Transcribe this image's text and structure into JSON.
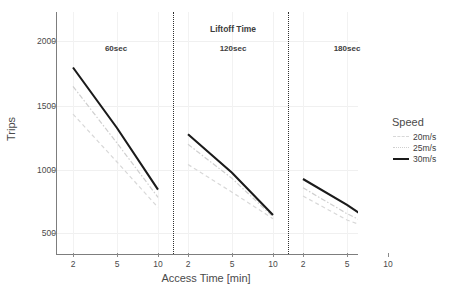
{
  "chart_data": {
    "type": "line",
    "title": "",
    "xlabel": "Access Time [min]",
    "ylabel": "Trips",
    "facet_title": "Liftoff Time",
    "facets": [
      "60sec",
      "120sec",
      "180sec"
    ],
    "categories": [
      "2",
      "5",
      "10"
    ],
    "x_tick_labels": [
      "2",
      "5",
      "10"
    ],
    "y_tick_labels": [
      "500",
      "1000",
      "1500",
      "2000"
    ],
    "y_ticks": [
      500,
      1000,
      1500,
      2000
    ],
    "ylim": [
      330,
      2250
    ],
    "grid": true,
    "legend_position": "right",
    "legend_title": "Speed",
    "series": [
      {
        "name": "20m/s",
        "style": "dashed",
        "color": "#d8d8d8",
        "values_60sec": [
          1440,
          1060,
          700
        ],
        "values_120sec": [
          1040,
          820,
          610
        ],
        "values_180sec": [
          790,
          600,
          480
        ]
      },
      {
        "name": "25m/s",
        "style": "dashdot",
        "color": "#cfcfcf",
        "values_60sec": [
          1660,
          1210,
          780
        ],
        "values_120sec": [
          1200,
          930,
          625
        ],
        "values_180sec": [
          855,
          650,
          490
        ]
      },
      {
        "name": "30m/s",
        "style": "solid",
        "color": "#1a1a1a",
        "values_60sec": [
          1810,
          1330,
          840
        ],
        "values_120sec": [
          1280,
          975,
          640
        ],
        "values_180sec": [
          925,
          720,
          500
        ]
      }
    ]
  },
  "axes": {
    "y_title": "Trips",
    "x_title": "Access Time [min]",
    "y_ticks": [
      "2000",
      "1500",
      "1000",
      "500"
    ],
    "x_ticks_panel1": [
      "2",
      "5",
      "10"
    ],
    "x_ticks_panel2": [
      "2",
      "5",
      "10"
    ],
    "x_ticks_panel3": [
      "2",
      "5",
      "10"
    ]
  },
  "facet_strip": {
    "title": "Liftoff Time",
    "labels": [
      "60sec",
      "120sec",
      "180sec"
    ]
  },
  "legend": {
    "title": "Speed",
    "entries": [
      {
        "label": "20m/s",
        "color": "#d8d8d8"
      },
      {
        "label": "25m/s",
        "color": "#cfcfcf"
      },
      {
        "label": "30m/s",
        "color": "#1a1a1a"
      }
    ]
  },
  "caption": {
    "text": ""
  }
}
